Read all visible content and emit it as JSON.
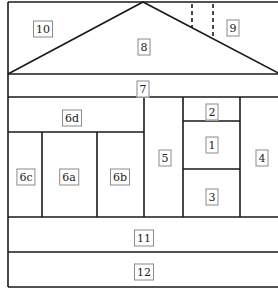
{
  "diagram": {
    "colors": {
      "line": "#1a1a1a",
      "label_border": "#8a8a8a",
      "background": "#ffffff"
    },
    "regions": [
      {
        "id": "1",
        "label": "1",
        "x": 212,
        "y": 145
      },
      {
        "id": "2",
        "label": "2",
        "x": 212,
        "y": 112
      },
      {
        "id": "3",
        "label": "3",
        "x": 212,
        "y": 197
      },
      {
        "id": "4",
        "label": "4",
        "x": 262,
        "y": 158
      },
      {
        "id": "5",
        "label": "5",
        "x": 165,
        "y": 158
      },
      {
        "id": "6a",
        "label": "6a",
        "x": 69,
        "y": 177
      },
      {
        "id": "6b",
        "label": "6b",
        "x": 120,
        "y": 177
      },
      {
        "id": "6c",
        "label": "6c",
        "x": 26,
        "y": 177
      },
      {
        "id": "6d",
        "label": "6d",
        "x": 72,
        "y": 118
      },
      {
        "id": "7",
        "label": "7",
        "x": 143,
        "y": 89
      },
      {
        "id": "8",
        "label": "8",
        "x": 144,
        "y": 47
      },
      {
        "id": "9",
        "label": "9",
        "x": 233,
        "y": 28
      },
      {
        "id": "10",
        "label": "10",
        "x": 43,
        "y": 29
      },
      {
        "id": "11",
        "label": "11",
        "x": 144,
        "y": 238
      },
      {
        "id": "12",
        "label": "12",
        "x": 144,
        "y": 272
      }
    ]
  }
}
